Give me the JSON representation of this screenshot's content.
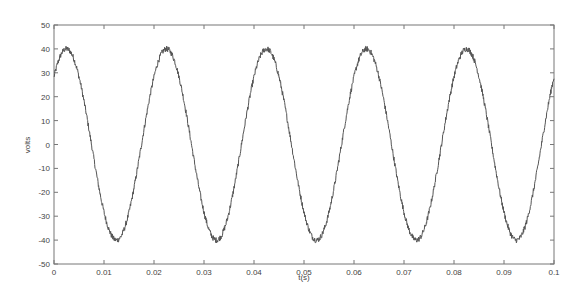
{
  "chart_data": {
    "type": "line",
    "title": "",
    "xlabel": "t(s)",
    "ylabel": "volts",
    "xlim": [
      0,
      0.1
    ],
    "ylim": [
      -50,
      50
    ],
    "grid": false,
    "legend": null,
    "xticks": [
      "0",
      "0.01",
      "0.02",
      "0.03",
      "0.04",
      "0.05",
      "0.06",
      "0.07",
      "0.08",
      "0.09",
      "0.1"
    ],
    "yticks": [
      "50",
      "40",
      "30",
      "20",
      "10",
      "0",
      "-10",
      "-20",
      "-30",
      "-40",
      "-50"
    ],
    "signal": {
      "form": "sine",
      "amplitude": 40,
      "frequency_hz": 50,
      "phase_deg": 45,
      "noise_amplitude": 1.2
    },
    "series": [
      {
        "name": "voltage",
        "color": "#555555",
        "x": [
          0,
          0.0025,
          0.005,
          0.0075,
          0.01,
          0.0125,
          0.015,
          0.0175,
          0.02,
          0.0225,
          0.025,
          0.0275,
          0.03,
          0.0325,
          0.035,
          0.0375,
          0.04,
          0.0425,
          0.045,
          0.0475,
          0.05,
          0.0525,
          0.055,
          0.0575,
          0.06,
          0.0625,
          0.065,
          0.0675,
          0.07,
          0.0725,
          0.075,
          0.0775,
          0.08,
          0.0825,
          0.085,
          0.0875,
          0.09,
          0.0925,
          0.095,
          0.0975,
          0.1
        ],
        "values": [
          28.3,
          40,
          28.3,
          0,
          -28.3,
          -40,
          -28.3,
          0,
          28.3,
          40,
          28.3,
          0,
          -28.3,
          -40,
          -28.3,
          0,
          28.3,
          40,
          28.3,
          0,
          -28.3,
          -40,
          -28.3,
          0,
          28.3,
          40,
          28.3,
          0,
          -28.3,
          -40,
          -28.3,
          0,
          28.3,
          40,
          28.3,
          0,
          -28.3,
          -40,
          -28.3,
          0,
          28.3
        ]
      }
    ]
  },
  "colors": {
    "axis": "#777777",
    "line": "#555555",
    "background": "#ffffff"
  }
}
